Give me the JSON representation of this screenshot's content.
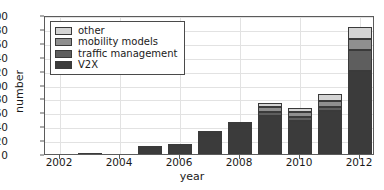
{
  "chart_data": {
    "type": "bar",
    "subtype": "stacked-bar",
    "title": "",
    "xlabel": "year",
    "ylabel": "number",
    "xlim": [
      2001.5,
      2012.5
    ],
    "ylim": [
      0,
      200
    ],
    "ytick_labels": [
      "0",
      "20",
      "40",
      "60",
      "80",
      "100",
      "120",
      "140",
      "160",
      "180",
      "200"
    ],
    "ytick_values": [
      0,
      20,
      40,
      60,
      80,
      100,
      120,
      140,
      160,
      180,
      200
    ],
    "xtick_labels": [
      "2002",
      "2004",
      "2006",
      "2008",
      "2010",
      "2012"
    ],
    "xtick_values": [
      2002,
      2004,
      2006,
      2008,
      2010,
      2012
    ],
    "grid": true,
    "legend_position": "upper left",
    "categories": [
      2002,
      2003,
      2004,
      2005,
      2006,
      2007,
      2008,
      2009,
      2010,
      2011,
      2012
    ],
    "series": [
      {
        "name": "V2X",
        "color": "#3b3b3b",
        "values": [
          0,
          1,
          0,
          9,
          11,
          26,
          37,
          55,
          48,
          62,
          120
        ]
      },
      {
        "name": "traffic management",
        "color": "#5e5e5e",
        "values": [
          0,
          0,
          0,
          2,
          3,
          3,
          3,
          5,
          5,
          5,
          30
        ]
      },
      {
        "name": "mobility models",
        "color": "#8f8f8f",
        "values": [
          0,
          0,
          0,
          1,
          1,
          2,
          3,
          7,
          8,
          9,
          15
        ]
      },
      {
        "name": "other",
        "color": "#d4d4d4",
        "values": [
          0,
          0,
          0,
          0,
          0,
          2,
          3,
          6,
          5,
          10,
          18
        ]
      }
    ],
    "totals": [
      0,
      1,
      0,
      12,
      15,
      33,
      46,
      73,
      66,
      86,
      183
    ]
  },
  "legend": {
    "items": [
      {
        "label": "other",
        "color": "#d4d4d4"
      },
      {
        "label": "mobility models",
        "color": "#8f8f8f"
      },
      {
        "label": "traffic management",
        "color": "#5e5e5e"
      },
      {
        "label": "V2X",
        "color": "#3b3b3b"
      }
    ]
  }
}
